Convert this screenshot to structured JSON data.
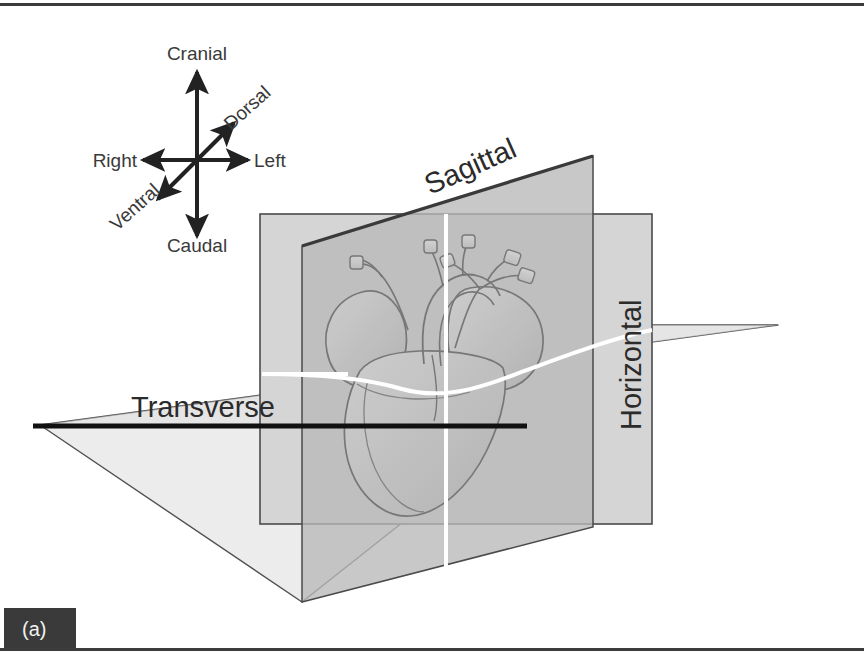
{
  "figure": {
    "panel_letter": "(a)",
    "frame": {
      "top_rule_color": "#3c3c3c",
      "bottom_rule_color": "#3c3c3c",
      "background": "#ffffff"
    }
  },
  "orientation_compass": {
    "name": "anatomical-direction-compass",
    "center": {
      "x": 197,
      "y": 160
    },
    "axes": [
      {
        "id": "cranial",
        "label": "Cranial",
        "direction": "up",
        "label_x": 197,
        "label_y": 60,
        "rotation": 0,
        "anchor": "middle"
      },
      {
        "id": "caudal",
        "label": "Caudal",
        "direction": "down",
        "label_x": 197,
        "label_y": 252,
        "rotation": 0,
        "anchor": "middle"
      },
      {
        "id": "right",
        "label": "Right",
        "direction": "left",
        "label_x": 137,
        "label_y": 166,
        "rotation": 0,
        "anchor": "end"
      },
      {
        "id": "left",
        "label": "Left",
        "direction": "right",
        "label_x": 253,
        "label_y": 166,
        "rotation": 0,
        "anchor": "start"
      },
      {
        "id": "dorsal",
        "label": "Dorsal",
        "direction": "up-right",
        "label_x": 231,
        "label_y": 132,
        "rotation": -40,
        "anchor": "start"
      },
      {
        "id": "ventral",
        "label": "Ventral",
        "direction": "down-left",
        "label_x": 163,
        "label_y": 190,
        "rotation": -40,
        "anchor": "end"
      }
    ],
    "arrow_color": "#222222"
  },
  "planes": [
    {
      "id": "frontal",
      "label": "Transverse",
      "label_x": 131,
      "label_y": 417,
      "label_size": 29,
      "fill": "#dcdcdc",
      "stroke": "#4a4a4a",
      "note": "vertical coronal/frontal slab shown as upright rectangle"
    },
    {
      "id": "sagittal",
      "label": "Sagittal",
      "label_x": 430,
      "label_y": 195,
      "label_size": 29,
      "label_rotation": -24,
      "fill": "#b8b8b8",
      "stroke": "#4a4a4a",
      "note": "oblique parallelogram running front-to-back"
    },
    {
      "id": "horizontal",
      "label": "Horizontal",
      "label_x": 641,
      "label_y": 430,
      "label_size": 29,
      "label_rotation": -90,
      "fill": "#e6e6e6",
      "stroke": "#4a4a4a",
      "note": "flat transverse slab viewed nearly edge-on"
    }
  ],
  "heart": {
    "name": "heart-illustration",
    "description": "Stylised heart with great vessels, drawn in grey line art at centre of the three planes",
    "outline_color": "#6e6e6e",
    "fill": "#c9c9c9"
  },
  "guide_lines": {
    "white_cross": {
      "color": "#ffffff",
      "vertical_x": 446,
      "horizontal_y": 372
    },
    "transverse_rule": {
      "color": "#111111",
      "y": 426,
      "x_start": 33,
      "x_end": 527
    }
  },
  "colors": {
    "ink": "#2b2b2b",
    "panel_badge_bg": "#3a3a3a",
    "panel_badge_text": "#f2f2f2",
    "plane_light": "#e6e6e6",
    "plane_mid": "#dcdcdc",
    "plane_dark": "#b8b8b8"
  }
}
